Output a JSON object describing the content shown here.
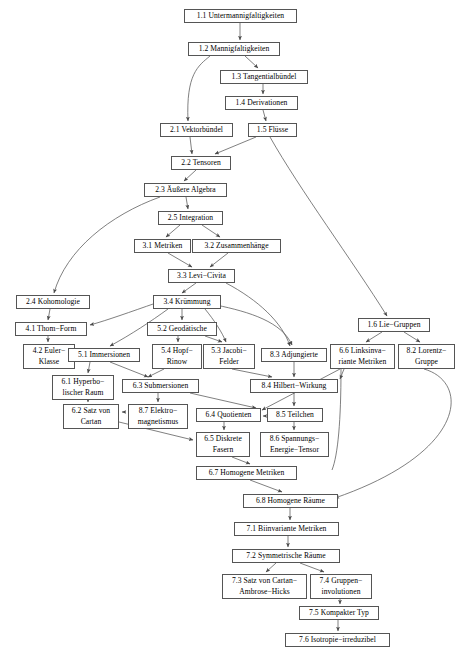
{
  "diagram": {
    "type": "dependency-graph",
    "language": "de",
    "line_color": "#555555",
    "box_border_color": "#555555",
    "background": "#ffffff",
    "nodes": [
      {
        "id": "1.1",
        "label": "1.1 Untermannigfaltigkeiten",
        "x": 184,
        "y": 9,
        "w": 113,
        "h": 14
      },
      {
        "id": "1.2",
        "label": "1.2 Mannigfaltigkeiten",
        "x": 188,
        "y": 42,
        "w": 92,
        "h": 14
      },
      {
        "id": "1.3",
        "label": "1.3 Tangentialbündel",
        "x": 220,
        "y": 70,
        "w": 88,
        "h": 14
      },
      {
        "id": "1.4",
        "label": "1.4 Derivationen",
        "x": 225,
        "y": 96,
        "w": 73,
        "h": 14
      },
      {
        "id": "1.5",
        "label": "1.5 Flüsse",
        "x": 248,
        "y": 123,
        "w": 49,
        "h": 14
      },
      {
        "id": "2.1",
        "label": "2.1 Vektorbündel",
        "x": 160,
        "y": 123,
        "w": 73,
        "h": 14
      },
      {
        "id": "2.2",
        "label": "2.2 Tensoren",
        "x": 171,
        "y": 156,
        "w": 60,
        "h": 14
      },
      {
        "id": "2.3",
        "label": "2.3 Äußere Algebra",
        "x": 144,
        "y": 183,
        "w": 83,
        "h": 14
      },
      {
        "id": "2.5",
        "label": "2.5 Integration",
        "x": 158,
        "y": 211,
        "w": 65,
        "h": 14
      },
      {
        "id": "3.1",
        "label": "3.1 Metriken",
        "x": 134,
        "y": 239,
        "w": 57,
        "h": 14
      },
      {
        "id": "3.2",
        "label": "3.2 Zusammenhänge",
        "x": 192,
        "y": 239,
        "w": 89,
        "h": 14
      },
      {
        "id": "3.3",
        "label": "3.3 Levi−Civita",
        "x": 168,
        "y": 269,
        "w": 67,
        "h": 14
      },
      {
        "id": "2.4",
        "label": "2.4 Kohomologie",
        "x": 16,
        "y": 295,
        "w": 74,
        "h": 14
      },
      {
        "id": "3.4",
        "label": "3.4 Krümmung",
        "x": 153,
        "y": 295,
        "w": 68,
        "h": 14
      },
      {
        "id": "4.1",
        "label": "4.1 Thom−Form",
        "x": 15,
        "y": 322,
        "w": 72,
        "h": 14
      },
      {
        "id": "5.2",
        "label": "5.2 Geodätische",
        "x": 147,
        "y": 322,
        "w": 70,
        "h": 14
      },
      {
        "id": "1.6",
        "label": "1.6 Lie−Gruppen",
        "x": 358,
        "y": 318,
        "w": 72,
        "h": 14
      },
      {
        "id": "4.2",
        "label": "4.2 Euler−\nKlasse",
        "x": 23,
        "y": 344,
        "w": 52,
        "h": 25,
        "two": true
      },
      {
        "id": "5.1",
        "label": "5.1 Immersionen",
        "x": 68,
        "y": 348,
        "w": 72,
        "h": 14
      },
      {
        "id": "5.4",
        "label": "5.4 Hopf−\nRinow",
        "x": 152,
        "y": 344,
        "w": 50,
        "h": 25,
        "two": true
      },
      {
        "id": "5.3",
        "label": "5.3 Jacobi−\nFelder",
        "x": 203,
        "y": 344,
        "w": 52,
        "h": 25,
        "two": true
      },
      {
        "id": "8.3",
        "label": "8.3 Adjungierte",
        "x": 261,
        "y": 348,
        "w": 66,
        "h": 14
      },
      {
        "id": "6.6",
        "label": "6.6 Linksinva−\nriante Metriken",
        "x": 330,
        "y": 344,
        "w": 65,
        "h": 25,
        "two": true
      },
      {
        "id": "8.2",
        "label": "8.2 Lorentz−\nGruppe",
        "x": 398,
        "y": 344,
        "w": 57,
        "h": 25,
        "two": true
      },
      {
        "id": "6.1",
        "label": "6.1 Hyperbo−\nlischer Raum",
        "x": 52,
        "y": 375,
        "w": 62,
        "h": 25,
        "two": true
      },
      {
        "id": "6.3",
        "label": "6.3 Submersionen",
        "x": 122,
        "y": 379,
        "w": 77,
        "h": 14
      },
      {
        "id": "8.4",
        "label": "8.4 Hilbert−Wirkung",
        "x": 250,
        "y": 379,
        "w": 88,
        "h": 14
      },
      {
        "id": "6.2",
        "label": "6.2 Satz von\nCartan",
        "x": 63,
        "y": 404,
        "w": 56,
        "h": 25,
        "two": true
      },
      {
        "id": "8.7",
        "label": "8.7 Elektro−\nmagnetismus",
        "x": 128,
        "y": 404,
        "w": 60,
        "h": 25,
        "two": true
      },
      {
        "id": "6.4",
        "label": "6.4 Quotienten",
        "x": 196,
        "y": 408,
        "w": 65,
        "h": 14
      },
      {
        "id": "8.5",
        "label": "8.5 Teilchen",
        "x": 267,
        "y": 408,
        "w": 56,
        "h": 14
      },
      {
        "id": "6.5",
        "label": "6.5 Diskrete\nFasern",
        "x": 196,
        "y": 432,
        "w": 54,
        "h": 25,
        "two": true
      },
      {
        "id": "8.6",
        "label": "8.6 Spannungs−\nEnergie−Tensor",
        "x": 260,
        "y": 432,
        "w": 69,
        "h": 25,
        "two": true
      },
      {
        "id": "6.7",
        "label": "6.7 Homogene Metriken",
        "x": 196,
        "y": 466,
        "w": 101,
        "h": 14
      },
      {
        "id": "6.8",
        "label": "6.8 Homogene Räume",
        "x": 243,
        "y": 494,
        "w": 95,
        "h": 14
      },
      {
        "id": "7.1",
        "label": "7.1 Biinvariante Metriken",
        "x": 234,
        "y": 522,
        "w": 105,
        "h": 14
      },
      {
        "id": "7.2",
        "label": "7.2 Symmetrische Räume",
        "x": 232,
        "y": 549,
        "w": 108,
        "h": 14
      },
      {
        "id": "7.3",
        "label": "7.3 Satz von Cartan−\nAmbrose−Hicks",
        "x": 222,
        "y": 574,
        "w": 85,
        "h": 25,
        "two": true
      },
      {
        "id": "7.4",
        "label": "7.4 Gruppen−\ninvolutionen",
        "x": 310,
        "y": 574,
        "w": 62,
        "h": 25,
        "two": true
      },
      {
        "id": "7.5",
        "label": "7.5 Kompakter Typ",
        "x": 299,
        "y": 606,
        "w": 80,
        "h": 14
      },
      {
        "id": "7.6",
        "label": "7.6 Isotropie−irreduzibel",
        "x": 285,
        "y": 633,
        "w": 105,
        "h": 14
      }
    ],
    "edges": [
      {
        "from": "1.1",
        "to": "1.2"
      },
      {
        "from": "1.2",
        "to": "1.3"
      },
      {
        "from": "1.2",
        "to": "2.1"
      },
      {
        "from": "1.3",
        "to": "1.4"
      },
      {
        "from": "1.4",
        "to": "1.5"
      },
      {
        "from": "1.5",
        "to": "2.2"
      },
      {
        "from": "1.5",
        "to": "1.6"
      },
      {
        "from": "2.1",
        "to": "2.2"
      },
      {
        "from": "2.2",
        "to": "2.3"
      },
      {
        "from": "2.3",
        "to": "2.5"
      },
      {
        "from": "2.3",
        "to": "2.4"
      },
      {
        "from": "2.5",
        "to": "3.1"
      },
      {
        "from": "2.5",
        "to": "3.2"
      },
      {
        "from": "3.1",
        "to": "3.3"
      },
      {
        "from": "3.2",
        "to": "3.3"
      },
      {
        "from": "3.3",
        "to": "3.4"
      },
      {
        "from": "3.3",
        "to": "8.3"
      },
      {
        "from": "2.4",
        "to": "4.1"
      },
      {
        "from": "3.4",
        "to": "4.1"
      },
      {
        "from": "3.4",
        "to": "5.1"
      },
      {
        "from": "3.4",
        "to": "5.2"
      },
      {
        "from": "3.4",
        "to": "5.3"
      },
      {
        "from": "3.4",
        "to": "8.3"
      },
      {
        "from": "4.1",
        "to": "4.2"
      },
      {
        "from": "5.2",
        "to": "5.4"
      },
      {
        "from": "5.2",
        "to": "5.3"
      },
      {
        "from": "1.6",
        "to": "6.6"
      },
      {
        "from": "1.6",
        "to": "8.2"
      },
      {
        "from": "5.1",
        "to": "6.1"
      },
      {
        "from": "5.1",
        "to": "6.3"
      },
      {
        "from": "5.4",
        "to": "6.3"
      },
      {
        "from": "5.3",
        "to": "8.4"
      },
      {
        "from": "8.3",
        "to": "8.4"
      },
      {
        "from": "6.6",
        "to": "8.4"
      },
      {
        "from": "6.6",
        "to": "6.4"
      },
      {
        "from": "8.2",
        "to": "6.8"
      },
      {
        "from": "6.1",
        "to": "6.2"
      },
      {
        "from": "6.3",
        "to": "8.7"
      },
      {
        "from": "6.3",
        "to": "6.4"
      },
      {
        "from": "8.4",
        "to": "8.5"
      },
      {
        "from": "8.7",
        "to": "6.2"
      },
      {
        "from": "8.5",
        "to": "6.4"
      },
      {
        "from": "6.2",
        "to": "6.5"
      },
      {
        "from": "6.4",
        "to": "6.5"
      },
      {
        "from": "8.5",
        "to": "8.6"
      },
      {
        "from": "6.5",
        "to": "6.7"
      },
      {
        "from": "6.7",
        "to": "6.8"
      },
      {
        "from": "6.8",
        "to": "7.1"
      },
      {
        "from": "7.1",
        "to": "7.2"
      },
      {
        "from": "7.2",
        "to": "7.3"
      },
      {
        "from": "7.2",
        "to": "7.4"
      },
      {
        "from": "7.4",
        "to": "7.5"
      },
      {
        "from": "7.5",
        "to": "7.6"
      }
    ],
    "paths": [
      {
        "name": "edge-1.1-1.2",
        "d": "M 240,23 L 240,40",
        "arrow": true
      },
      {
        "name": "edge-1.2-1.3",
        "d": "M 245,56 L 258,68",
        "arrow": true
      },
      {
        "name": "edge-1.2-2.1",
        "d": "M 210,56 C 198,66 186,74 188,121",
        "arrow": true
      },
      {
        "name": "edge-1.3-1.4",
        "d": "M 263,84 L 263,94",
        "arrow": true
      },
      {
        "name": "edge-1.4-1.5",
        "d": "M 263,110 L 266,121",
        "arrow": true
      },
      {
        "name": "edge-2.1-2.2",
        "d": "M 190,137 L 192,154",
        "arrow": true
      },
      {
        "name": "edge-1.5-2.2",
        "d": "M 256,137 L 215,154",
        "arrow": true
      },
      {
        "name": "edge-1.5-1.6",
        "d": "M 270,137 C 300,190 352,260 387,316",
        "arrow": true
      },
      {
        "name": "edge-2.2-2.3",
        "d": "M 196,170 L 184,181",
        "arrow": true
      },
      {
        "name": "edge-2.3-2.5",
        "d": "M 186,197 L 188,209",
        "arrow": true
      },
      {
        "name": "edge-2.3-2.4",
        "d": "M 160,197 C 110,215 66,250 54,293",
        "arrow": true
      },
      {
        "name": "edge-2.5-3.1",
        "d": "M 180,225 L 166,237",
        "arrow": true
      },
      {
        "name": "edge-2.5-3.2",
        "d": "M 202,225 L 220,237",
        "arrow": true
      },
      {
        "name": "edge-3.1-3.3",
        "d": "M 168,253 L 192,267",
        "arrow": true
      },
      {
        "name": "edge-3.2-3.3",
        "d": "M 228,253 L 210,267",
        "arrow": true
      },
      {
        "name": "edge-3.3-3.4",
        "d": "M 196,283 L 182,293",
        "arrow": true
      },
      {
        "name": "edge-3.3-8.3",
        "d": "M 226,283 C 258,300 282,322 290,346",
        "arrow": true
      },
      {
        "name": "edge-2.4-4.1",
        "d": "M 50,309 L 48,320",
        "arrow": true
      },
      {
        "name": "edge-3.4-4.1",
        "d": "M 156,303 C 130,312 108,320 90,325",
        "arrow": true
      },
      {
        "name": "edge-3.4-5.2",
        "d": "M 182,309 L 182,320",
        "arrow": true
      },
      {
        "name": "edge-3.4-5.1",
        "d": "M 168,309 C 150,322 132,334 110,346",
        "arrow": true
      },
      {
        "name": "edge-3.4-5.3",
        "d": "M 205,309 C 214,320 222,332 226,342",
        "arrow": true
      },
      {
        "name": "edge-3.4-8.3",
        "d": "M 216,305 C 250,312 282,322 292,345",
        "arrow": true
      },
      {
        "name": "edge-4.1-4.2",
        "d": "M 48,336 L 48,342",
        "arrow": true
      },
      {
        "name": "edge-5.2-5.4",
        "d": "M 178,336 L 178,342",
        "arrow": true
      },
      {
        "name": "edge-5.2-5.3",
        "d": "M 205,336 L 222,342",
        "arrow": true
      },
      {
        "name": "edge-1.6-6.6",
        "d": "M 382,332 L 366,342",
        "arrow": true
      },
      {
        "name": "edge-1.6-8.2",
        "d": "M 404,332 L 420,342",
        "arrow": true
      },
      {
        "name": "edge-5.1-6.1",
        "d": "M 90,362 L 88,373",
        "arrow": true
      },
      {
        "name": "edge-5.1-6.3",
        "d": "M 110,362 L 148,377",
        "arrow": true
      },
      {
        "name": "edge-5.4-6.3",
        "d": "M 164,369 L 148,377",
        "arrow": true
      },
      {
        "name": "edge-5.3-8.4",
        "d": "M 232,369 L 272,377",
        "arrow": true
      },
      {
        "name": "edge-8.3-8.4",
        "d": "M 294,362 L 294,377",
        "arrow": true
      },
      {
        "name": "edge-6.6-8.4",
        "d": "M 344,369 L 340,379",
        "arrow": true
      },
      {
        "name": "edge-6.6-6.4",
        "d": "M 340,369 L 262,410",
        "arrow": true
      },
      {
        "name": "edge-6.6-line",
        "d": "M 341,369 C 341,420 338,455 332,470",
        "arrow": false
      },
      {
        "name": "edge-8.2-6.8",
        "d": "M 424,369 C 470,382 468,452 335,498",
        "arrow": true
      },
      {
        "name": "edge-6.1-6.2",
        "d": "M 88,400 L 88,402",
        "arrow": true
      },
      {
        "name": "edge-6.3-8.7",
        "d": "M 158,393 L 158,402",
        "arrow": true
      },
      {
        "name": "edge-6.3-6.4",
        "d": "M 190,393 L 256,408",
        "arrow": true
      },
      {
        "name": "edge-8.4-8.5",
        "d": "M 294,393 L 294,406",
        "arrow": true
      },
      {
        "name": "edge-8.7-6.2",
        "d": "M 126,412 L 122,412",
        "arrow": true
      },
      {
        "name": "edge-8.5-6.4",
        "d": "M 266,416 L 263,416",
        "arrow": true
      },
      {
        "name": "edge-6.2-6.5",
        "d": "M 119,422 L 193,440",
        "arrow": true
      },
      {
        "name": "edge-6.4-6.5",
        "d": "M 224,422 L 224,430",
        "arrow": true
      },
      {
        "name": "edge-8.5-8.6",
        "d": "M 294,422 L 294,430",
        "arrow": true
      },
      {
        "name": "edge-6.5-6.7",
        "d": "M 232,457 L 250,464",
        "arrow": true
      },
      {
        "name": "edge-6.7-6.8",
        "d": "M 250,480 L 282,492",
        "arrow": true
      },
      {
        "name": "edge-6.8-7.1",
        "d": "M 290,508 L 290,520",
        "arrow": true
      },
      {
        "name": "edge-7.1-7.2",
        "d": "M 288,536 L 288,547",
        "arrow": true
      },
      {
        "name": "edge-7.2-7.3",
        "d": "M 276,563 L 266,572",
        "arrow": true
      },
      {
        "name": "edge-7.2-7.4",
        "d": "M 300,563 L 324,572",
        "arrow": true
      },
      {
        "name": "edge-7.4-7.5",
        "d": "M 340,599 L 340,604",
        "arrow": true
      },
      {
        "name": "edge-7.5-7.6",
        "d": "M 338,620 L 338,631",
        "arrow": true
      }
    ]
  }
}
